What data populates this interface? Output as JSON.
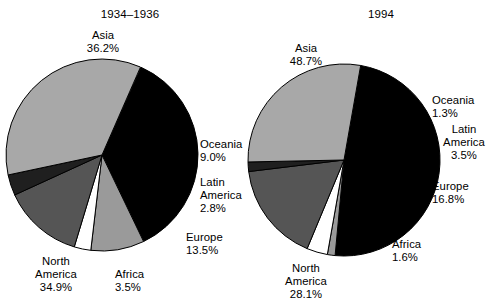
{
  "figure": {
    "panels": [
      {
        "title": "1934–1936",
        "title_pos": {
          "left": 56,
          "top": 8,
          "width": 148
        },
        "pie": {
          "cx": 102,
          "cy": 155,
          "r": 96,
          "start_angle": -66
        },
        "slices": [
          {
            "name": "Asia",
            "value": "36.2%",
            "pct": 36.2,
            "color": "#000000",
            "label": {
              "left": 57,
              "top": 29,
              "width": 92,
              "align": "ta-c"
            }
          },
          {
            "name": "Oceania",
            "value": "9.0%",
            "pct": 9.0,
            "color": "#9a9a9a",
            "label": {
              "left": 200,
              "top": 138,
              "width": 62,
              "align": "ta-l"
            }
          },
          {
            "name": "Latin\nAmerica",
            "value": "2.8%",
            "pct": 2.8,
            "color": "#ffffff",
            "label": {
              "left": 200,
              "top": 176,
              "width": 62,
              "align": "ta-l"
            }
          },
          {
            "name": "Europe",
            "value": "13.5%",
            "pct": 13.5,
            "color": "#555555",
            "label": {
              "left": 186,
              "top": 231,
              "width": 62,
              "align": "ta-l"
            }
          },
          {
            "name": "Africa",
            "value": "3.5%",
            "pct": 3.5,
            "color": "#1f1f1f",
            "label": {
              "left": 115,
              "top": 268,
              "width": 62,
              "align": "ta-l"
            }
          },
          {
            "name": "North\nAmerica",
            "value": "34.9%",
            "pct": 34.9,
            "color": "#a8a8a8",
            "label": {
              "left": 22,
              "top": 255,
              "width": 68,
              "align": "ta-c"
            }
          }
        ]
      },
      {
        "title": "1994",
        "title_pos": {
          "left": 60,
          "top": 8,
          "width": 148
        },
        "pie": {
          "cx": 344,
          "cy": 160,
          "r": 96,
          "start_angle": -80
        },
        "slices": [
          {
            "name": "Asia",
            "value": "48.7%",
            "pct": 48.7,
            "color": "#000000",
            "label": {
              "left": 268,
              "top": 42,
              "width": 76,
              "align": "ta-c"
            }
          },
          {
            "name": "Oceania",
            "value": "1.3%",
            "pct": 1.3,
            "color": "#9a9a9a",
            "label": {
              "left": 432,
              "top": 94,
              "width": 62,
              "align": "ta-l"
            }
          },
          {
            "name": "Latin\nAmerica",
            "value": "3.5%",
            "pct": 3.5,
            "color": "#ffffff",
            "label": {
              "left": 434,
              "top": 123,
              "width": 60,
              "align": "ta-c"
            }
          },
          {
            "name": "Europe",
            "value": "16.8%",
            "pct": 16.8,
            "color": "#555555",
            "label": {
              "left": 432,
              "top": 180,
              "width": 62,
              "align": "ta-l"
            }
          },
          {
            "name": "Africa",
            "value": "1.6%",
            "pct": 1.6,
            "color": "#1f1f1f",
            "label": {
              "left": 392,
              "top": 238,
              "width": 62,
              "align": "ta-l"
            }
          },
          {
            "name": "North\nAmerica",
            "value": "28.1%",
            "pct": 28.1,
            "color": "#a8a8a8",
            "label": {
              "left": 272,
              "top": 262,
              "width": 68,
              "align": "ta-c"
            }
          }
        ]
      }
    ]
  },
  "chart_data": [
    {
      "type": "pie",
      "title": "1934–1936",
      "categories": [
        "Asia",
        "Oceania",
        "Latin America",
        "Europe",
        "Africa",
        "North America"
      ],
      "values": [
        36.2,
        9.0,
        2.8,
        13.5,
        3.5,
        34.9
      ],
      "value_labels": [
        "36.2%",
        "9.0%",
        "2.8%",
        "13.5%",
        "3.5%",
        "34.9%"
      ],
      "colors": [
        "#000000",
        "#9a9a9a",
        "#ffffff",
        "#555555",
        "#1f1f1f",
        "#a8a8a8"
      ],
      "unit": "percent",
      "legend": "none",
      "grid": false,
      "xlabel": "",
      "ylabel": ""
    },
    {
      "type": "pie",
      "title": "1994",
      "categories": [
        "Asia",
        "Oceania",
        "Latin America",
        "Europe",
        "Africa",
        "North America"
      ],
      "values": [
        48.7,
        1.3,
        3.5,
        16.8,
        1.6,
        28.1
      ],
      "value_labels": [
        "48.7%",
        "1.3%",
        "3.5%",
        "16.8%",
        "1.6%",
        "28.1%"
      ],
      "colors": [
        "#000000",
        "#9a9a9a",
        "#ffffff",
        "#555555",
        "#1f1f1f",
        "#a8a8a8"
      ],
      "unit": "percent",
      "legend": "none",
      "grid": false,
      "xlabel": "",
      "ylabel": ""
    }
  ]
}
